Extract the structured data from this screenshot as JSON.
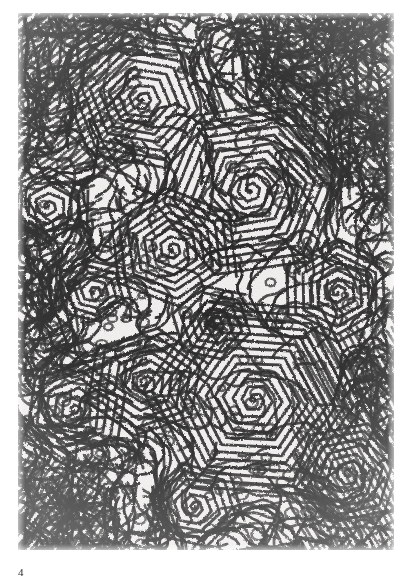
{
  "page": {
    "background_color": "#ffffff",
    "width": 411,
    "height": 586
  },
  "figure": {
    "number_label": "4",
    "kind": "micrograph",
    "plate": {
      "x": 18,
      "y": 13,
      "width": 376,
      "height": 537,
      "background_color": "#f2f1ef",
      "stroke_color": "#2b2b2b",
      "highlight_color": "#ffffff"
    },
    "pattern": {
      "style": "labyrinth-spiral",
      "line_color": "#272727",
      "gap_color": "#f4f3f1",
      "stripe_period_px": 6.0,
      "hex_domains": [
        {
          "cx": 0.33,
          "cy": 0.16,
          "radius": 0.17,
          "turns": 9,
          "rotation": 12,
          "squash": 0.92
        },
        {
          "cx": 0.62,
          "cy": 0.33,
          "radius": 0.2,
          "turns": 11,
          "rotation": -8,
          "squash": 0.95
        },
        {
          "cx": 0.41,
          "cy": 0.44,
          "radius": 0.14,
          "turns": 8,
          "rotation": 25,
          "squash": 0.9
        },
        {
          "cx": 0.63,
          "cy": 0.72,
          "radius": 0.23,
          "turns": 13,
          "rotation": 5,
          "squash": 0.96
        },
        {
          "cx": 0.34,
          "cy": 0.69,
          "radius": 0.13,
          "turns": 7,
          "rotation": -20,
          "squash": 0.88
        },
        {
          "cx": 0.15,
          "cy": 0.74,
          "radius": 0.11,
          "turns": 6,
          "rotation": 40,
          "squash": 0.93
        },
        {
          "cx": 0.85,
          "cy": 0.52,
          "radius": 0.12,
          "turns": 7,
          "rotation": -30,
          "squash": 0.9
        },
        {
          "cx": 0.47,
          "cy": 0.92,
          "radius": 0.1,
          "turns": 6,
          "rotation": 15,
          "squash": 0.94
        },
        {
          "cx": 0.88,
          "cy": 0.86,
          "radius": 0.12,
          "turns": 7,
          "rotation": -12,
          "squash": 0.91
        },
        {
          "cx": 0.08,
          "cy": 0.36,
          "radius": 0.09,
          "turns": 5,
          "rotation": 33,
          "squash": 0.89
        },
        {
          "cx": 0.52,
          "cy": 0.58,
          "radius": 0.09,
          "turns": 5,
          "rotation": -45,
          "squash": 0.92
        },
        {
          "cx": 0.2,
          "cy": 0.52,
          "radius": 0.08,
          "turns": 5,
          "rotation": 18,
          "squash": 0.9
        }
      ],
      "fine_maze_regions": [
        {
          "x": 0.0,
          "y": 0.0,
          "w": 1.0,
          "h": 0.22,
          "density": "high"
        },
        {
          "x": 0.0,
          "y": 0.3,
          "w": 0.34,
          "h": 0.55,
          "density": "high"
        },
        {
          "x": 0.7,
          "y": 0.0,
          "w": 0.3,
          "h": 0.45,
          "density": "high"
        }
      ]
    }
  },
  "caption": {
    "text": "4"
  }
}
